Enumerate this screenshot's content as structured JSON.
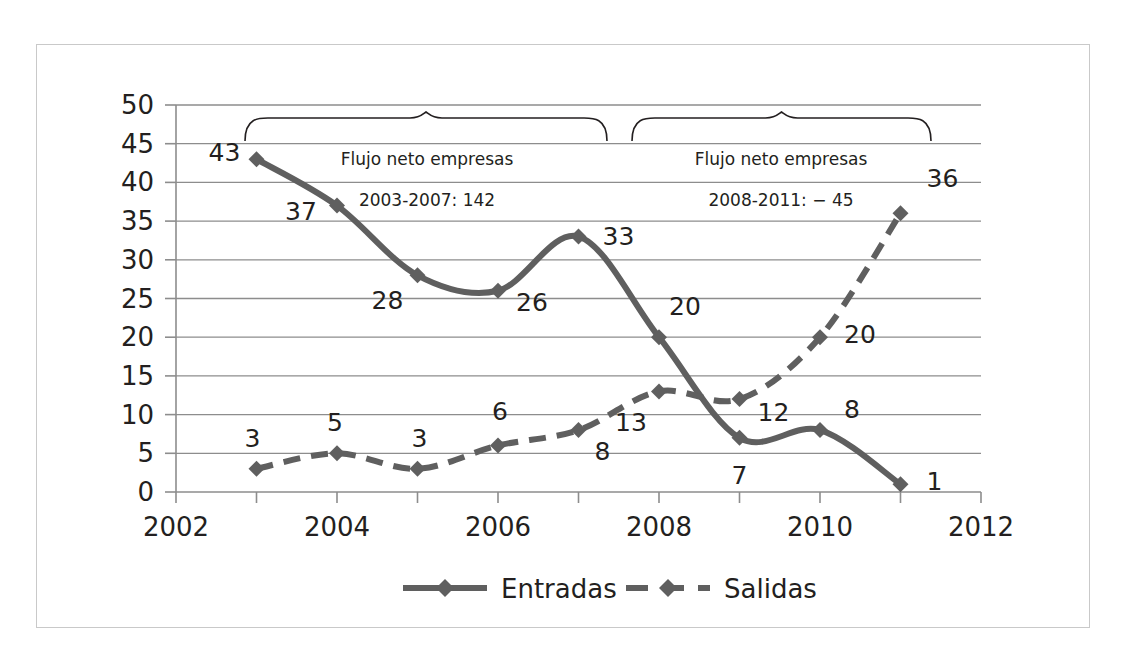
{
  "chart_data": {
    "type": "line",
    "title": "",
    "xlabel": "",
    "ylabel": "",
    "x": [
      2003,
      2004,
      2005,
      2006,
      2007,
      2008,
      2009,
      2010,
      2011
    ],
    "xlim": [
      2002,
      2012
    ],
    "ylim": [
      0,
      50
    ],
    "ytick_step": 5,
    "grid": true,
    "legend_position": "bottom",
    "smoothed_lines": true,
    "xticks": [
      "2002",
      "2004",
      "2006",
      "2008",
      "2010",
      "2012"
    ],
    "xtick_values": [
      2002,
      2004,
      2006,
      2008,
      2010,
      2012
    ],
    "yticks": [
      "0",
      "5",
      "10",
      "15",
      "20",
      "25",
      "30",
      "35",
      "40",
      "45",
      "50"
    ],
    "ytick_values": [
      0,
      5,
      10,
      15,
      20,
      25,
      30,
      35,
      40,
      45,
      50
    ],
    "series": [
      {
        "name": "Entradas",
        "style": "solid",
        "marker": "diamond",
        "color": "#5f5f5f",
        "values": [
          43,
          37,
          28,
          26,
          33,
          20,
          7,
          8,
          1
        ],
        "labels": [
          "43",
          "37",
          "28",
          "26",
          "33",
          "20",
          "7",
          "8",
          "1"
        ]
      },
      {
        "name": "Salidas",
        "style": "dashed",
        "marker": "diamond",
        "color": "#5f5f5f",
        "values": [
          3,
          5,
          3,
          6,
          8,
          13,
          12,
          20,
          36
        ],
        "labels": [
          "3",
          "5",
          "3",
          "6",
          "8",
          "13",
          "12",
          "20",
          "36"
        ]
      }
    ],
    "annotations": [
      {
        "id": "flujo-neto-2003-2007",
        "line1": "Flujo neto empresas",
        "line2": "2003-2007: 142",
        "span": [
          2003,
          2007
        ],
        "value": 142
      },
      {
        "id": "flujo-neto-2008-2011",
        "line1": "Flujo neto empresas",
        "line2": "2008-2011: − 45",
        "span": [
          2008,
          2011
        ],
        "value": -45
      }
    ],
    "legend": [
      {
        "label": "Entradas",
        "style": "solid"
      },
      {
        "label": "Salidas",
        "style": "dashed"
      }
    ]
  },
  "colors": {
    "series": "#5f5f5f",
    "grid": "#8d8d8d",
    "text": "#231f20",
    "frame": "#c9c9c9",
    "background": "#ffffff"
  }
}
